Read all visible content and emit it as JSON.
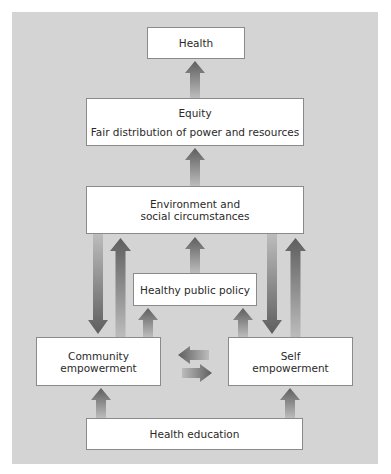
{
  "diagram": {
    "nodes": {
      "health": {
        "label": "Health"
      },
      "equity": {
        "label": "Equity",
        "sublabel": "Fair distribution of power and resources"
      },
      "environment": {
        "line1": "Environment and",
        "line2": "social circumstances"
      },
      "policy": {
        "label": "Healthy public policy"
      },
      "community": {
        "line1": "Community",
        "line2": "empowerment"
      },
      "self": {
        "line1": "Self",
        "line2": "empowerment"
      },
      "education": {
        "label": "Health education"
      }
    },
    "edges": [
      {
        "from": "Equity",
        "to": "Health"
      },
      {
        "from": "Environment and social circumstances",
        "to": "Equity"
      },
      {
        "from": "Healthy public policy",
        "to": "Environment and social circumstances"
      },
      {
        "from": "Environment and social circumstances",
        "to": "Community empowerment"
      },
      {
        "from": "Community empowerment",
        "to": "Environment and social circumstances"
      },
      {
        "from": "Environment and social circumstances",
        "to": "Self empowerment"
      },
      {
        "from": "Self empowerment",
        "to": "Environment and social circumstances"
      },
      {
        "from": "Community empowerment",
        "to": "Healthy public policy"
      },
      {
        "from": "Self empowerment",
        "to": "Healthy public policy"
      },
      {
        "from": "Self empowerment",
        "to": "Community empowerment"
      },
      {
        "from": "Community empowerment",
        "to": "Self empowerment"
      },
      {
        "from": "Health education",
        "to": "Community empowerment"
      },
      {
        "from": "Health education",
        "to": "Self empowerment"
      }
    ],
    "colors": {
      "panel": "#d4d4d4",
      "box": "#ffffff",
      "arrow_dark": "#5e5e5e",
      "arrow_light": "#b8b8b8"
    }
  }
}
